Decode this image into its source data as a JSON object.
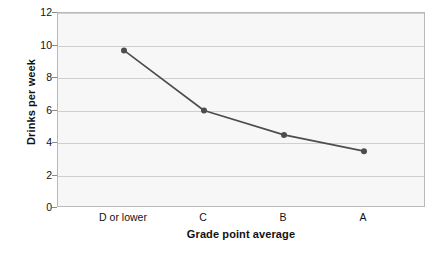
{
  "chart_data": {
    "type": "line",
    "title": "",
    "subtitle": "",
    "xlabel": "Grade point average",
    "ylabel": "Drinks per week",
    "categories": [
      "D or lower",
      "C",
      "B",
      "A"
    ],
    "values": [
      9.7,
      6.0,
      4.5,
      3.5
    ],
    "series": [
      {
        "name": "Drinks per week",
        "values": [
          9.7,
          6.0,
          4.5,
          3.5
        ]
      }
    ],
    "ylim": [
      0,
      12
    ],
    "y_ticks": [
      0,
      2,
      4,
      6,
      8,
      10,
      12
    ],
    "y_tick_labels": [
      "0",
      "2",
      "4",
      "6",
      "8",
      "10",
      "12"
    ],
    "grid": true,
    "grid_axis": "y",
    "legend": false,
    "legend_position": "none",
    "annotations": [],
    "marker": "circle",
    "colors": {
      "line": "#4d4d4d",
      "marker": "#4d4d4d",
      "plot_background": "#f7f7f7",
      "plot_border": "#b9b9b9",
      "gridline": "#cfcfcf",
      "text": "#111111"
    }
  }
}
